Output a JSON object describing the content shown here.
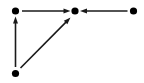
{
  "figure": {
    "kind": "directed-graph-diagram",
    "width": 144,
    "height": 83,
    "background_color": "#ffffff",
    "ink_color": "#1a1a1a",
    "node_color": "#000000",
    "node_radius": 3.6,
    "edge_width": 1.6,
    "arrowhead_length": 7,
    "arrowhead_width": 5
  },
  "nodes": [
    {
      "id": "n1",
      "name": "top-left-node",
      "x": 15.5,
      "y": 11,
      "label": ""
    },
    {
      "id": "n2",
      "name": "top-center-node",
      "x": 75,
      "y": 11,
      "label": ""
    },
    {
      "id": "n3",
      "name": "top-right-node",
      "x": 133.5,
      "y": 11,
      "label": ""
    },
    {
      "id": "n4",
      "name": "bottom-left-node",
      "x": 15.5,
      "y": 73.5,
      "label": ""
    }
  ],
  "edges": [
    {
      "id": "e1",
      "name": "edge-top-left-to-center",
      "from": "n1",
      "to": "n2",
      "directed": true,
      "x1": 22,
      "y1": 11,
      "x2": 70.5,
      "y2": 11,
      "label": ""
    },
    {
      "id": "e2",
      "name": "edge-top-right-to-center",
      "from": "n3",
      "to": "n2",
      "directed": true,
      "x1": 127.5,
      "y1": 11,
      "x2": 80,
      "y2": 11,
      "label": ""
    },
    {
      "id": "e3",
      "name": "edge-bottom-left-to-top-left",
      "from": "n4",
      "to": "n1",
      "directed": true,
      "x1": 15.5,
      "y1": 67,
      "x2": 15.5,
      "y2": 16.5,
      "label": ""
    },
    {
      "id": "e4",
      "name": "edge-bottom-left-to-center",
      "from": "n4",
      "to": "n2",
      "directed": true,
      "x1": 20.5,
      "y1": 68,
      "x2": 70.5,
      "y2": 17.5,
      "label": ""
    }
  ]
}
